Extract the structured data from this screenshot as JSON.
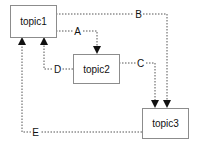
{
  "diagram": {
    "type": "directed-graph",
    "nodes": [
      {
        "id": "topic1",
        "label": "topic1",
        "x": 10,
        "y": 5,
        "w": 46,
        "h": 32
      },
      {
        "id": "topic2",
        "label": "topic2",
        "x": 73,
        "y": 54,
        "w": 46,
        "h": 29
      },
      {
        "id": "topic3",
        "label": "topic3",
        "x": 142,
        "y": 108,
        "w": 46,
        "h": 30
      }
    ],
    "edges": [
      {
        "id": "A",
        "label": "A",
        "from": "topic1",
        "to": "topic2"
      },
      {
        "id": "B",
        "label": "B",
        "from": "topic1",
        "to": "topic3"
      },
      {
        "id": "C",
        "label": "C",
        "from": "topic2",
        "to": "topic3"
      },
      {
        "id": "D",
        "label": "D",
        "from": "topic2",
        "to": "topic1"
      },
      {
        "id": "E",
        "label": "E",
        "from": "topic3",
        "to": "topic1"
      }
    ],
    "colors": {
      "node_border": "#8c8c8c",
      "edge": "#555555",
      "arrow": "#111111",
      "text": "#111111",
      "background": "#ffffff"
    }
  }
}
